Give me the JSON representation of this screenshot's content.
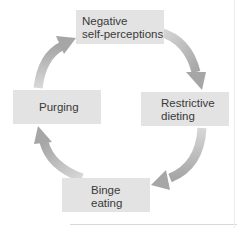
{
  "diagram": {
    "type": "cycle",
    "title": "",
    "nodes": [
      {
        "id": "negative",
        "lines": [
          "Negative",
          "self-perceptions"
        ]
      },
      {
        "id": "restrictive",
        "lines": [
          "Restrictive",
          "dieting"
        ]
      },
      {
        "id": "binge",
        "lines": [
          "Binge",
          "eating"
        ]
      },
      {
        "id": "purging",
        "lines": [
          "Purging"
        ]
      }
    ],
    "edges": [
      {
        "from": "negative",
        "to": "restrictive"
      },
      {
        "from": "restrictive",
        "to": "binge"
      },
      {
        "from": "binge",
        "to": "purging"
      },
      {
        "from": "purging",
        "to": "negative"
      }
    ],
    "colors": {
      "box_fill": "#e3e3e3",
      "text": "#3a3a3a",
      "arrow_dark": "#a8a8a8",
      "arrow_light": "#d6d6d6"
    }
  }
}
